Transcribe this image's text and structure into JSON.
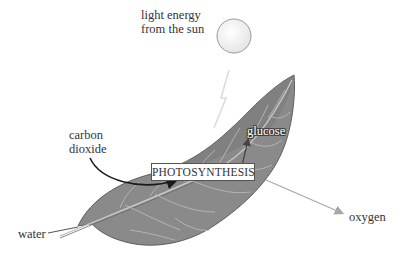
{
  "diagram": {
    "title": "Photosynthesis",
    "sun": {
      "label_line1": "light energy",
      "label_line2": "from the sun"
    },
    "inputs": {
      "carbon_dioxide": {
        "line1": "carbon",
        "line2": "dioxide"
      },
      "water": "water"
    },
    "process": "PHOTOSYNTHESIS",
    "outputs": {
      "glucose": "glucose",
      "oxygen": "oxygen"
    },
    "colors": {
      "leaf_fill": "#8a8a8a",
      "leaf_dark": "#6e6e6e",
      "leaf_vein": "#b8b8b8",
      "arrow_dark": "#1a1a1a",
      "arrow_light": "#aaaaaa",
      "text": "#333333"
    }
  }
}
